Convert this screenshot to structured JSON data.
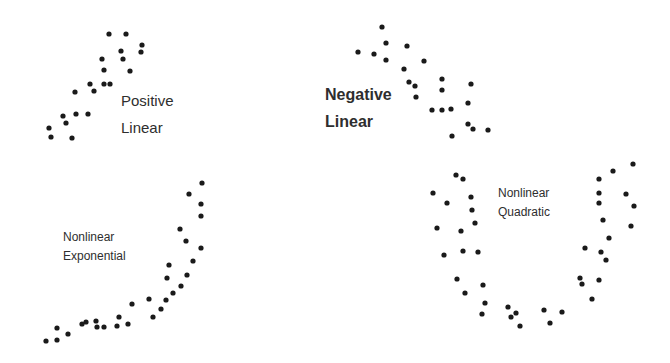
{
  "chart_data": [
    {
      "type": "scatter",
      "title": "Positive Linear",
      "label_lines": [
        "Positive",
        "Linear"
      ],
      "label_pos": [
        121,
        106
      ],
      "label_class": "md",
      "points": [
        [
          109,
          34
        ],
        [
          126,
          34
        ],
        [
          142,
          45
        ],
        [
          141,
          52
        ],
        [
          121,
          51
        ],
        [
          123,
          59
        ],
        [
          102,
          59
        ],
        [
          104,
          70
        ],
        [
          130,
          71
        ],
        [
          90,
          84
        ],
        [
          104,
          84
        ],
        [
          110,
          84
        ],
        [
          75,
          92
        ],
        [
          94,
          91
        ],
        [
          63,
          116
        ],
        [
          76,
          114
        ],
        [
          88,
          114
        ],
        [
          66,
          123
        ],
        [
          49,
          128
        ],
        [
          51,
          137
        ],
        [
          72,
          138
        ]
      ]
    },
    {
      "type": "scatter",
      "title": "Negative Linear",
      "label_lines": [
        "Negative",
        "Linear"
      ],
      "label_pos": [
        325,
        100
      ],
      "label_class": "lg",
      "points": [
        [
          382,
          27
        ],
        [
          386,
          43
        ],
        [
          407,
          46
        ],
        [
          358,
          52
        ],
        [
          374,
          54
        ],
        [
          386,
          60
        ],
        [
          424,
          61
        ],
        [
          404,
          69
        ],
        [
          409,
          82
        ],
        [
          415,
          86
        ],
        [
          442,
          79
        ],
        [
          471,
          84
        ],
        [
          442,
          90
        ],
        [
          416,
          97
        ],
        [
          468,
          103
        ],
        [
          432,
          110
        ],
        [
          442,
          110
        ],
        [
          451,
          109
        ],
        [
          468,
          124
        ],
        [
          473,
          129
        ],
        [
          488,
          130
        ],
        [
          452,
          136
        ]
      ]
    },
    {
      "type": "scatter",
      "title": "Nonlinear Exponential",
      "label_lines": [
        "Nonlinear",
        "Exponential"
      ],
      "label_pos": [
        63,
        241
      ],
      "label_class": "sm",
      "points": [
        [
          202,
          183
        ],
        [
          189,
          194
        ],
        [
          201,
          204
        ],
        [
          201,
          216
        ],
        [
          180,
          229
        ],
        [
          186,
          241
        ],
        [
          201,
          248
        ],
        [
          193,
          261
        ],
        [
          169,
          265
        ],
        [
          167,
          278
        ],
        [
          187,
          275
        ],
        [
          181,
          286
        ],
        [
          173,
          293
        ],
        [
          149,
          299
        ],
        [
          166,
          300
        ],
        [
          132,
          304
        ],
        [
          161,
          309
        ],
        [
          119,
          317
        ],
        [
          153,
          317
        ],
        [
          82,
          324
        ],
        [
          86,
          322
        ],
        [
          96,
          321
        ],
        [
          97,
          327
        ],
        [
          104,
          327
        ],
        [
          117,
          326
        ],
        [
          128,
          324
        ],
        [
          68,
          334
        ],
        [
          57,
          328
        ],
        [
          57,
          340
        ],
        [
          46,
          341
        ]
      ]
    },
    {
      "type": "scatter",
      "title": "Nonlinear Quadratic",
      "label_lines": [
        "Nonlinear",
        "Quadratic"
      ],
      "label_pos": [
        498,
        197
      ],
      "label_class": "sm",
      "points": [
        [
          456,
          175
        ],
        [
          463,
          179
        ],
        [
          433,
          193
        ],
        [
          447,
          203
        ],
        [
          471,
          197
        ],
        [
          472,
          210
        ],
        [
          437,
          228
        ],
        [
          461,
          231
        ],
        [
          475,
          223
        ],
        [
          444,
          255
        ],
        [
          463,
          251
        ],
        [
          478,
          252
        ],
        [
          457,
          279
        ],
        [
          483,
          285
        ],
        [
          465,
          293
        ],
        [
          485,
          303
        ],
        [
          482,
          314
        ],
        [
          508,
          307
        ],
        [
          516,
          313
        ],
        [
          511,
          317
        ],
        [
          520,
          326
        ],
        [
          544,
          310
        ],
        [
          550,
          323
        ],
        [
          562,
          312
        ],
        [
          592,
          299
        ],
        [
          580,
          278
        ],
        [
          582,
          284
        ],
        [
          599,
          280
        ],
        [
          585,
          248
        ],
        [
          601,
          252
        ],
        [
          606,
          260
        ],
        [
          609,
          238
        ],
        [
          603,
          220
        ],
        [
          599,
          203
        ],
        [
          599,
          193
        ],
        [
          599,
          179
        ],
        [
          613,
          171
        ],
        [
          633,
          164
        ],
        [
          626,
          194
        ],
        [
          634,
          206
        ],
        [
          631,
          226
        ]
      ]
    }
  ],
  "style": {
    "dot_color": "#1a1a1a",
    "dot_radius": 2.6,
    "text_color": "#2e2e2e"
  }
}
